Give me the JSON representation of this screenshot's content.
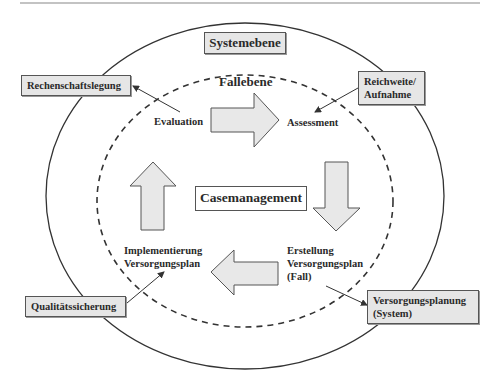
{
  "diagram": {
    "outer_level": {
      "label": "Systemebene"
    },
    "inner_level": {
      "label": "Fallebene"
    },
    "core": {
      "label": "Casemanagement"
    },
    "cycle_steps": [
      {
        "id": "evaluation",
        "label": "Evaluation"
      },
      {
        "id": "assessment",
        "label": "Assessment"
      },
      {
        "id": "erstellung",
        "line1": "Erstellung",
        "line2": "Versorgungsplan",
        "line3": "(Fall)"
      },
      {
        "id": "implementierung",
        "line1": "Implementierung",
        "line2": "Versorgungsplan"
      }
    ],
    "system_boxes": [
      {
        "id": "rechenschaftslegung",
        "label": "Rechenschaftslegung",
        "linked_to": "Evaluation"
      },
      {
        "id": "reichweite",
        "line1": "Reichweite/",
        "line2": "Aufnahme",
        "linked_to": "Assessment"
      },
      {
        "id": "versorgungsplanung",
        "line1": "Versorgungsplanung",
        "line2": "(System)",
        "linked_from": "Erstellung Versorgungsplan (Fall)"
      },
      {
        "id": "qualitaetssicherung",
        "label": "Qualitätssicherung",
        "linked_to": "Implementierung Versorgungsplan"
      }
    ],
    "cycle_arrows": [
      {
        "id": "evaluation-to-assessment",
        "direction": "right"
      },
      {
        "id": "assessment-to-erstellung",
        "direction": "down"
      },
      {
        "id": "erstellung-to-implementierung",
        "direction": "left"
      },
      {
        "id": "implementierung-to-evaluation",
        "direction": "up"
      }
    ],
    "colors": {
      "box_fill": "#e6e6e6",
      "arrow_fill": "#e8e8e8",
      "stroke": "#333333",
      "core_fill": "#ffffff"
    }
  }
}
